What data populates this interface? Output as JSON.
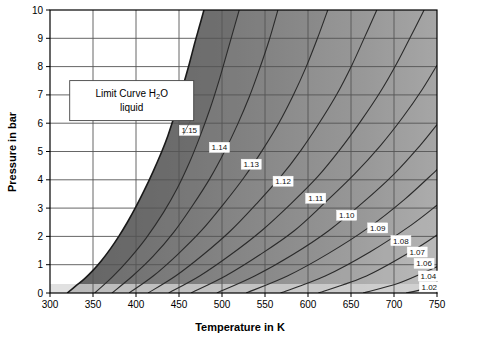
{
  "figure": {
    "background": "#ffffff",
    "plot_background": "#ffffff",
    "axis_color": "#000000",
    "grid_color": "#555555"
  },
  "annotation": {
    "name": "limit-curve-callout",
    "line1_pre": "Limit Curve H",
    "line1_sub": "2",
    "line1_post": "O",
    "line2": "liquid",
    "box_fill": "#ffffff",
    "box_stroke": "#444444"
  },
  "chart_data": {
    "type": "line",
    "title": "",
    "subtitle": "",
    "xlabel": "Temperature in K",
    "ylabel": "Pressure in bar",
    "xlim": [
      300,
      750
    ],
    "ylim": [
      0,
      10
    ],
    "xticks": [
      300,
      350,
      400,
      450,
      500,
      550,
      600,
      650,
      700,
      750
    ],
    "xticklabels": [
      "300",
      "350",
      "400",
      "450",
      "500",
      "550",
      "600",
      "650",
      "700",
      "750"
    ],
    "yticks": [
      0,
      1,
      2,
      3,
      4,
      5,
      6,
      7,
      8,
      9,
      10
    ],
    "yticklabels": [
      "0",
      "1",
      "2",
      "3",
      "4",
      "5",
      "6",
      "7",
      "8",
      "9",
      "10"
    ],
    "grid": true,
    "legend": "none",
    "legend_position": "none",
    "shading": "grayscale contour bands, dark near limit curve, lighter toward lower right",
    "annotations": [
      {
        "text": "Limit Curve H2O liquid",
        "x": 395,
        "y": 6.8,
        "points_to_x": 455,
        "points_to_y": 5.6
      }
    ],
    "limit_curve": {
      "name": "Limit Curve H2O liquid",
      "description": "left boundary of shaded region; saturation/limit curve of liquid water",
      "points": [
        [
          320,
          0.0
        ],
        [
          330,
          0.25
        ],
        [
          340,
          0.5
        ],
        [
          350,
          0.8
        ],
        [
          360,
          1.15
        ],
        [
          370,
          1.55
        ],
        [
          380,
          2.0
        ],
        [
          390,
          2.5
        ],
        [
          400,
          3.05
        ],
        [
          410,
          3.65
        ],
        [
          420,
          4.3
        ],
        [
          430,
          5.0
        ],
        [
          437,
          5.55
        ],
        [
          444,
          6.2
        ],
        [
          450,
          6.8
        ],
        [
          456,
          7.45
        ],
        [
          462,
          8.1
        ],
        [
          468,
          8.8
        ],
        [
          474,
          9.45
        ],
        [
          479,
          10.0
        ]
      ]
    },
    "series": [
      {
        "name": "1.15",
        "label": "1.15",
        "label_x": 462,
        "label_y": 5.75,
        "points": [
          [
            352,
            0.0
          ],
          [
            372,
            0.55
          ],
          [
            392,
            1.2
          ],
          [
            412,
            1.95
          ],
          [
            432,
            2.85
          ],
          [
            448,
            3.7
          ],
          [
            462,
            4.6
          ],
          [
            474,
            5.5
          ],
          [
            486,
            6.5
          ],
          [
            496,
            7.45
          ],
          [
            505,
            8.4
          ],
          [
            513,
            9.25
          ],
          [
            520,
            10.0
          ]
        ]
      },
      {
        "name": "1.14",
        "label": "1.14",
        "label_x": 497,
        "label_y": 5.15,
        "points": [
          [
            372,
            0.0
          ],
          [
            396,
            0.6
          ],
          [
            420,
            1.3
          ],
          [
            444,
            2.15
          ],
          [
            466,
            3.1
          ],
          [
            486,
            4.05
          ],
          [
            503,
            5.0
          ],
          [
            518,
            5.95
          ],
          [
            532,
            6.95
          ],
          [
            544,
            7.95
          ],
          [
            555,
            8.95
          ],
          [
            565,
            10.0
          ]
        ]
      },
      {
        "name": "1.13",
        "label": "1.13",
        "label_x": 534,
        "label_y": 4.55,
        "points": [
          [
            392,
            0.0
          ],
          [
            420,
            0.6
          ],
          [
            448,
            1.35
          ],
          [
            476,
            2.2
          ],
          [
            502,
            3.15
          ],
          [
            526,
            4.1
          ],
          [
            547,
            5.05
          ],
          [
            566,
            6.0
          ],
          [
            583,
            7.0
          ],
          [
            598,
            8.0
          ],
          [
            611,
            9.0
          ],
          [
            623,
            10.0
          ]
        ]
      },
      {
        "name": "1.12",
        "label": "1.12",
        "label_x": 571,
        "label_y": 3.95,
        "points": [
          [
            414,
            0.0
          ],
          [
            446,
            0.6
          ],
          [
            478,
            1.35
          ],
          [
            510,
            2.2
          ],
          [
            540,
            3.15
          ],
          [
            568,
            4.1
          ],
          [
            592,
            5.05
          ],
          [
            614,
            6.05
          ],
          [
            634,
            7.05
          ],
          [
            651,
            8.05
          ],
          [
            666,
            9.05
          ],
          [
            680,
            10.0
          ]
        ]
      },
      {
        "name": "1.11",
        "label": "1.11",
        "label_x": 609,
        "label_y": 3.35,
        "points": [
          [
            438,
            0.0
          ],
          [
            474,
            0.6
          ],
          [
            510,
            1.35
          ],
          [
            546,
            2.2
          ],
          [
            580,
            3.15
          ],
          [
            611,
            4.1
          ],
          [
            638,
            5.1
          ],
          [
            662,
            6.1
          ],
          [
            684,
            7.1
          ],
          [
            703,
            8.1
          ],
          [
            720,
            9.1
          ],
          [
            735,
            10.0
          ]
        ]
      },
      {
        "name": "1.10",
        "label": "1.10",
        "label_x": 645,
        "label_y": 2.75,
        "points": [
          [
            464,
            0.0
          ],
          [
            504,
            0.6
          ],
          [
            544,
            1.35
          ],
          [
            584,
            2.2
          ],
          [
            620,
            3.2
          ],
          [
            654,
            4.2
          ],
          [
            684,
            5.2
          ],
          [
            710,
            6.2
          ],
          [
            733,
            7.2
          ],
          [
            750,
            8.05
          ]
        ]
      },
      {
        "name": "1.09",
        "label": "1.09",
        "label_x": 681,
        "label_y": 2.3,
        "points": [
          [
            494,
            0.0
          ],
          [
            538,
            0.6
          ],
          [
            582,
            1.35
          ],
          [
            624,
            2.2
          ],
          [
            664,
            3.2
          ],
          [
            700,
            4.2
          ],
          [
            730,
            5.2
          ],
          [
            750,
            5.95
          ]
        ]
      },
      {
        "name": "1.08",
        "label": "1.08",
        "label_x": 708,
        "label_y": 1.85,
        "points": [
          [
            528,
            0.0
          ],
          [
            576,
            0.6
          ],
          [
            624,
            1.4
          ],
          [
            670,
            2.3
          ],
          [
            712,
            3.3
          ],
          [
            748,
            4.3
          ],
          [
            750,
            4.35
          ]
        ]
      },
      {
        "name": "1.07",
        "label": "1.07",
        "label_x": 727,
        "label_y": 1.45,
        "points": [
          [
            568,
            0.0
          ],
          [
            620,
            0.6
          ],
          [
            672,
            1.45
          ],
          [
            720,
            2.4
          ],
          [
            750,
            3.1
          ]
        ]
      },
      {
        "name": "1.06",
        "label": "1.06",
        "label_x": 735,
        "label_y": 1.05,
        "points": [
          [
            612,
            0.0
          ],
          [
            668,
            0.6
          ],
          [
            722,
            1.5
          ],
          [
            750,
            2.05
          ]
        ]
      },
      {
        "name": "1.04",
        "label": "1.04",
        "label_x": 740,
        "label_y": 0.6,
        "points": [
          [
            664,
            0.0
          ],
          [
            706,
            0.35
          ],
          [
            748,
            0.9
          ],
          [
            750,
            0.93
          ]
        ]
      },
      {
        "name": "1.02",
        "label": "1.02",
        "label_x": 741,
        "label_y": 0.22,
        "points": [
          [
            714,
            0.0
          ],
          [
            732,
            0.12
          ],
          [
            750,
            0.3
          ]
        ]
      }
    ]
  }
}
